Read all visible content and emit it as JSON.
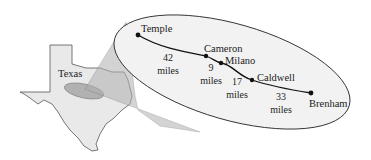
{
  "diagram": {
    "state_label": "Texas",
    "cities": [
      {
        "name": "Temple"
      },
      {
        "name": "Cameron"
      },
      {
        "name": "Milano"
      },
      {
        "name": "Caldwell"
      },
      {
        "name": "Brenham"
      }
    ],
    "segments": [
      {
        "distance": "42",
        "unit": "miles"
      },
      {
        "distance": "9",
        "unit": "miles"
      },
      {
        "distance": "17",
        "unit": "miles"
      },
      {
        "distance": "33",
        "unit": "miles"
      }
    ],
    "colors": {
      "state_fill": "#e9e9e9",
      "state_stroke": "#555555",
      "highlight_fill": "#9a9a9a",
      "cone_fill": "#b5b5b5",
      "ellipse_fill": "#f2f2f2",
      "route": "#111111"
    }
  }
}
